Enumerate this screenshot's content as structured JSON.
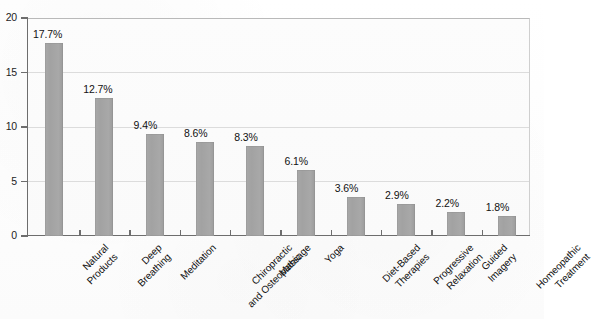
{
  "chart_data": {
    "type": "bar",
    "title": "",
    "subtitle": "",
    "xlabel": "",
    "ylabel": "",
    "ylim": [
      0,
      20
    ],
    "yticks": [
      "0",
      "5",
      "10",
      "15",
      "20"
    ],
    "grid": true,
    "legend": "none",
    "orientation": "vertical",
    "bar_color": "#a8a8a8",
    "axis_color": "#6d6d6d",
    "gridline_color": "#dcdcdc",
    "label_rotation": -45,
    "categories": [
      "Natural Products",
      "Deep Breathing",
      "Meditation",
      "Chiropractic and Osteopathic",
      "Massage",
      "Yoga",
      "Diet-Based Therapies",
      "Progressive Relaxation",
      "Guided Imagery",
      "Homeopathic Treatment"
    ],
    "category_lines": [
      [
        "Natural",
        "Products"
      ],
      [
        "Deep",
        "Breathing"
      ],
      [
        "Meditation"
      ],
      [
        "Chiropractic",
        "and Osteopathic"
      ],
      [
        "Massage"
      ],
      [
        "Yoga"
      ],
      [
        "Diet-Based",
        "Therapies"
      ],
      [
        "Progressive",
        "Relaxation"
      ],
      [
        "Guided",
        "Imagery"
      ],
      [
        "Homeopathic",
        "Treatment"
      ]
    ],
    "values": [
      17.7,
      12.7,
      9.4,
      8.6,
      8.3,
      6.1,
      3.6,
      2.9,
      2.2,
      1.8
    ],
    "value_labels": [
      "17.7%",
      "12.7%",
      "9.4%",
      "8.6%",
      "8.3%",
      "6.1%",
      "3.6%",
      "2.9%",
      "2.2%",
      "1.8%"
    ]
  }
}
